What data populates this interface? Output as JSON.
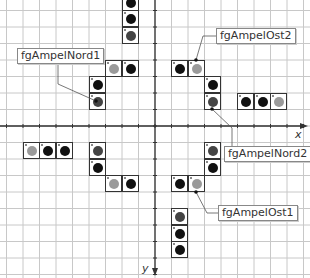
{
  "diagram": {
    "title": "",
    "grid": {
      "origin_x": 155,
      "origin_y": 126,
      "spacing": 16.5,
      "line_color": "#c8c8c8",
      "axis_color": "#333333"
    },
    "axes": {
      "x_label": "x",
      "y_label": "y"
    },
    "colors": {
      "black": "#111111",
      "dark": "#444444",
      "light": "#9a9a9a"
    },
    "labels": [
      {
        "id": "fgAmpelNord1",
        "text": "fgAmpelNord1",
        "x": 17,
        "y": 48,
        "anchor": [
          96,
          101
        ],
        "line": [
          [
            58,
            62
          ],
          [
            58,
            84
          ],
          [
            96,
            101
          ]
        ]
      },
      {
        "id": "fgAmpelOst2",
        "text": "fgAmpelOst2",
        "x": 216,
        "y": 28,
        "anchor": [
          196,
          60
        ],
        "line": [
          [
            216,
            36
          ],
          [
            203,
            36
          ],
          [
            196,
            60
          ]
        ]
      },
      {
        "id": "fgAmpelNord2",
        "text": "fgAmpelNord2",
        "x": 224,
        "y": 146,
        "anchor": [
          212,
          109
        ],
        "line": [
          [
            232,
            146
          ],
          [
            232,
            128
          ],
          [
            212,
            109
          ]
        ]
      },
      {
        "id": "fgAmpelOst1",
        "text": "fgAmpelOst1",
        "x": 218,
        "y": 205,
        "anchor": [
          196,
          192
        ],
        "line": [
          [
            218,
            213
          ],
          [
            207,
            213
          ],
          [
            196,
            192
          ]
        ]
      }
    ],
    "cells": [
      {
        "x": 122,
        "y": -6,
        "c": "black"
      },
      {
        "x": 122,
        "y": 10,
        "c": "black"
      },
      {
        "x": 122,
        "y": 27,
        "c": "dark"
      },
      {
        "x": 105,
        "y": 60,
        "c": "light"
      },
      {
        "x": 122,
        "y": 60,
        "c": "black"
      },
      {
        "x": 89,
        "y": 76,
        "c": "black"
      },
      {
        "x": 89,
        "y": 93,
        "c": "dark"
      },
      {
        "x": 171,
        "y": 60,
        "c": "black"
      },
      {
        "x": 188,
        "y": 60,
        "c": "light"
      },
      {
        "x": 204,
        "y": 76,
        "c": "black"
      },
      {
        "x": 204,
        "y": 93,
        "c": "dark"
      },
      {
        "x": 237,
        "y": 93,
        "c": "black"
      },
      {
        "x": 254,
        "y": 93,
        "c": "black"
      },
      {
        "x": 270,
        "y": 93,
        "c": "light"
      },
      {
        "x": 23,
        "y": 142,
        "c": "light"
      },
      {
        "x": 39,
        "y": 142,
        "c": "black"
      },
      {
        "x": 56,
        "y": 142,
        "c": "black"
      },
      {
        "x": 89,
        "y": 142,
        "c": "dark"
      },
      {
        "x": 89,
        "y": 159,
        "c": "black"
      },
      {
        "x": 105,
        "y": 175,
        "c": "light"
      },
      {
        "x": 122,
        "y": 175,
        "c": "black"
      },
      {
        "x": 204,
        "y": 142,
        "c": "dark"
      },
      {
        "x": 204,
        "y": 159,
        "c": "black"
      },
      {
        "x": 171,
        "y": 175,
        "c": "black"
      },
      {
        "x": 188,
        "y": 175,
        "c": "light"
      },
      {
        "x": 171,
        "y": 208,
        "c": "dark"
      },
      {
        "x": 171,
        "y": 225,
        "c": "black"
      },
      {
        "x": 171,
        "y": 241,
        "c": "black"
      }
    ]
  }
}
